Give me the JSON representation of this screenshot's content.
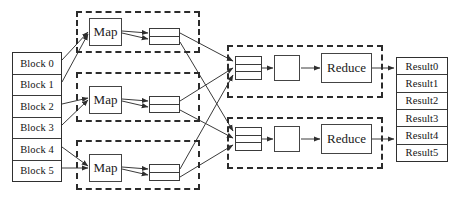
{
  "diagram": {
    "type": "flow-diagram",
    "background_color": "#ffffff",
    "line_color": "#3a3a3a",
    "dashed_border_color": "#2b2b2b"
  },
  "input": {
    "name": "input-blocks",
    "items": [
      {
        "label": "Block 0"
      },
      {
        "label": "Block 1"
      },
      {
        "label": "Block 2"
      },
      {
        "label": "Block 3"
      },
      {
        "label": "Block 4"
      },
      {
        "label": "Block 5"
      }
    ]
  },
  "map_stage": {
    "tasks": [
      {
        "label": "Map",
        "buffer_rows": 2
      },
      {
        "label": "Map",
        "buffer_rows": 2
      },
      {
        "label": "Map",
        "buffer_rows": 2
      }
    ]
  },
  "reduce_stage": {
    "tasks": [
      {
        "input_rows": 3,
        "merge_label": "",
        "label": "Reduce"
      },
      {
        "input_rows": 3,
        "merge_label": "",
        "label": "Reduce"
      }
    ]
  },
  "output": {
    "name": "output-results",
    "items": [
      {
        "label": "Result0"
      },
      {
        "label": "Result1"
      },
      {
        "label": "Result2"
      },
      {
        "label": "Result3"
      },
      {
        "label": "Result4"
      },
      {
        "label": "Result5"
      }
    ]
  }
}
